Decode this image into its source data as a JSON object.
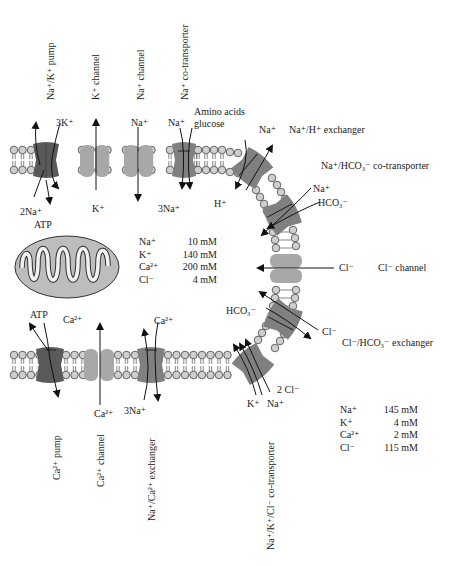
{
  "diagram": {
    "colors": {
      "pump_dark": "#5a5a5a",
      "channel_light": "#a8a8a8",
      "transporter_mid": "#808080",
      "lipid_head": "#cfcfcf",
      "mitochondrion": "#bdbdbd",
      "arrow": "#111111"
    },
    "top_transporters": [
      {
        "name": "Na+/K+ pump",
        "ions_in": "3K+",
        "ions_out": "2Na+",
        "energy": "ATP"
      },
      {
        "name": "K+ channel",
        "ion": "K+"
      },
      {
        "name": "Na+ channel",
        "ion": "Na+"
      },
      {
        "name": "Na+ co-transporter",
        "ions_outside": [
          "Na+",
          "Amino acids",
          "glucose"
        ],
        "ions_inside": "3Na+"
      }
    ],
    "right_transporters": [
      {
        "name": "Na+/H+ exchanger",
        "ions": [
          "Na+",
          "H+"
        ]
      },
      {
        "name": "Na+/HCO3- co-transporter",
        "ions": [
          "Na+",
          "HCO3-"
        ]
      },
      {
        "name": "Cl- channel",
        "ion": "Cl-"
      },
      {
        "name": "Cl-/HCO3- exchanger",
        "ions": [
          "HCO3-",
          "Cl-"
        ]
      }
    ],
    "bottom_transporters": [
      {
        "name": "Ca2+ pump",
        "ions": [
          "Ca2+"
        ],
        "energy": "ATP"
      },
      {
        "name": "Ca2+ channel",
        "ion": "Ca2+"
      },
      {
        "name": "Na+/Ca2+ exchanger",
        "ions": [
          "Ca2+",
          "3Na+"
        ]
      },
      {
        "name": "Na+/K+/Cl- co-transporter",
        "ions": [
          "2 Cl-",
          "K+",
          "Na+"
        ]
      }
    ],
    "organelle": {
      "name": "mitochondrion",
      "product": "ATP"
    },
    "intracellular_concentrations": [
      {
        "ion": "Na+",
        "value": "10 mM"
      },
      {
        "ion": "K+",
        "value": "140 mM"
      },
      {
        "ion": "Ca2+",
        "value": "200 mM"
      },
      {
        "ion": "Cl-",
        "value": "4 mM"
      }
    ],
    "extracellular_concentrations": [
      {
        "ion": "Na+",
        "value": "145 mM"
      },
      {
        "ion": "K+",
        "value": "4 mM"
      },
      {
        "ion": "Ca2+",
        "value": "2 mM"
      },
      {
        "ion": "Cl-",
        "value": "115 mM"
      }
    ]
  },
  "labels": {
    "nak_pump": "Na⁺/K⁺ pump",
    "k_channel": "K⁺ channel",
    "na_channel": "Na⁺ channel",
    "na_cotransporter": "Na⁺ co-transporter",
    "three_k": "3K⁺",
    "two_na": "2Na⁺",
    "atp_top": "ATP",
    "k_plus": "K⁺",
    "na_plus_channel": "Na⁺",
    "na_plus_cotrans": "Na⁺",
    "amino_acids": "Amino acids",
    "glucose": "glucose",
    "three_na_top": "3Na⁺",
    "na_plus_exch": "Na⁺",
    "nah_exchanger": "Na⁺/H⁺ exchanger",
    "h_plus": "H⁺",
    "na_hco3_cotransporter": "Na⁺/HCO₃⁻ co-transporter",
    "na_plus_hco3": "Na⁺",
    "hco3_a": "HCO₃⁻",
    "cl_ion": "Cl⁻",
    "cl_channel": "Cl⁻ channel",
    "hco3_b": "HCO₃⁻",
    "cl_ion_b": "Cl⁻",
    "cl_hco3_exchanger": "Cl⁻/HCO₃⁻ exchanger",
    "two_cl": "2 Cl⁻",
    "k_plus_b": "K⁺",
    "na_plus_b": "Na⁺",
    "atp_bottom": "ATP",
    "ca_pump_ion": "Ca²⁺",
    "ca_channel_ion": "Ca²⁺",
    "ca_exch_ion": "Ca²⁺",
    "three_na_bottom": "3Na⁺",
    "ca_pump": "Ca²⁺ pump",
    "ca_channel": "Ca²⁺ channel",
    "na_ca_exchanger": "Na⁺/Ca²⁺ exchanger",
    "na_k_cl_cotransporter": "Na⁺/K⁺/Cl⁻ co-transporter"
  },
  "conc_in": [
    {
      "ion": "Na⁺",
      "value": "10 mM"
    },
    {
      "ion": "K⁺",
      "value": "140 mM"
    },
    {
      "ion": "Ca²⁺",
      "value": "200 mM"
    },
    {
      "ion": "Cl⁻",
      "value": "4 mM"
    }
  ],
  "conc_out": [
    {
      "ion": "Na⁺",
      "value": "145 mM"
    },
    {
      "ion": "K⁺",
      "value": "4 mM"
    },
    {
      "ion": "Ca²⁺",
      "value": "2 mM"
    },
    {
      "ion": "Cl⁻",
      "value": "115 mM"
    }
  ]
}
